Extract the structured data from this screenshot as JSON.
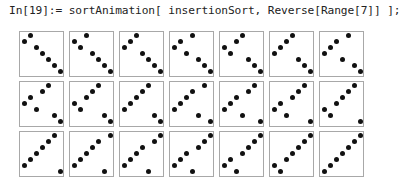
{
  "notebook": {
    "input_label": "In[19]:=",
    "input_code": "sortAnimation[ insertionSort, Reverse[Range[7]] ];"
  },
  "output": {
    "n": 7,
    "columns": 7,
    "frames": [
      [
        6,
        7,
        5,
        4,
        3,
        2,
        1
      ],
      [
        6,
        5,
        7,
        4,
        3,
        2,
        1
      ],
      [
        5,
        6,
        7,
        4,
        3,
        2,
        1
      ],
      [
        5,
        6,
        4,
        7,
        3,
        2,
        1
      ],
      [
        5,
        4,
        6,
        7,
        3,
        2,
        1
      ],
      [
        4,
        5,
        6,
        7,
        3,
        2,
        1
      ],
      [
        4,
        5,
        6,
        3,
        7,
        2,
        1
      ],
      [
        4,
        5,
        3,
        6,
        7,
        2,
        1
      ],
      [
        4,
        3,
        5,
        6,
        7,
        2,
        1
      ],
      [
        3,
        4,
        5,
        6,
        7,
        2,
        1
      ],
      [
        3,
        4,
        5,
        6,
        2,
        7,
        1
      ],
      [
        3,
        4,
        5,
        2,
        6,
        7,
        1
      ],
      [
        3,
        4,
        2,
        5,
        6,
        7,
        1
      ],
      [
        3,
        2,
        4,
        5,
        6,
        7,
        1
      ],
      [
        2,
        3,
        4,
        5,
        6,
        7,
        1
      ],
      [
        2,
        3,
        4,
        5,
        6,
        1,
        7
      ],
      [
        2,
        3,
        4,
        5,
        1,
        6,
        7
      ],
      [
        2,
        3,
        4,
        1,
        5,
        6,
        7
      ],
      [
        2,
        3,
        1,
        4,
        5,
        6,
        7
      ],
      [
        2,
        1,
        3,
        4,
        5,
        6,
        7
      ],
      [
        1,
        2,
        3,
        4,
        5,
        6,
        7
      ]
    ]
  }
}
